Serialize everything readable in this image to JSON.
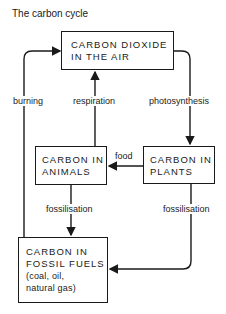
{
  "title": "The carbon cycle",
  "nodes": {
    "air": {
      "line1": "CARBON DIOXIDE",
      "line2": "IN THE AIR"
    },
    "animals": {
      "line1": "CARBON IN",
      "line2": "ANIMALS"
    },
    "plants": {
      "line1": "CARBON IN",
      "line2": "PLANTS"
    },
    "fossil": {
      "line1": "CARBON IN",
      "line2": "FOSSIL FUELS",
      "line3": "(coal, oil,",
      "line4": "natural gas)"
    }
  },
  "edges": {
    "burning": "burning",
    "respiration": "respiration",
    "photosynthesis": "photosynthesis",
    "food": "food",
    "fossilisation_animals": "fossilisation",
    "fossilisation_plants": "fossilisation"
  }
}
